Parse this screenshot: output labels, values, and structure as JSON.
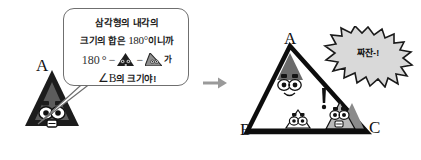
{
  "scene": {
    "title": "triangle-interior-angle-sum-cartoon",
    "colors": {
      "ink": "#111111",
      "bubble_border": "#6f6f6f",
      "burst_fill": "#d9d9d9",
      "burst_border": "#1a1a1a",
      "triangle_dark": "#2b2b2b",
      "triangle_gray": "#8c8c8c",
      "arrow_gray": "#9a9a9a",
      "page_bg": "#ffffff"
    }
  },
  "speech_bubble": {
    "line1": "삼각형의 내각의",
    "line2_prefix": "크기의 합은 ",
    "line2_number": "180",
    "line2_degree": "°",
    "line2_suffix": "이니까",
    "equation": {
      "number": "180",
      "degree": "°",
      "minus1": "−",
      "term1_icon": "dark-triangle-character-icon",
      "minus2": "−",
      "term2_icon": "gray-triangle-character-icon",
      "particle": "가"
    },
    "line4_angle": "∠B",
    "line4_text": "의 크기야!",
    "tail_direction": "down-left"
  },
  "left_character": {
    "label": "A",
    "icon": "dark-triangle-character-with-glasses-icon"
  },
  "transition": {
    "icon": "right-arrow-icon"
  },
  "right_scene": {
    "vertex_labels": {
      "top": "A",
      "bottom_left": "B",
      "bottom_right": "C"
    },
    "characters": [
      {
        "position": "top-vertex",
        "icon": "dark-triangle-character-with-glasses-icon"
      },
      {
        "position": "bottom-center",
        "icon": "small-triangle-character-icon"
      },
      {
        "position": "bottom-right",
        "icon": "gray-triangle-character-icon"
      }
    ],
    "exclamation": "!",
    "burst": {
      "text": "짜잔-!",
      "shape": "starburst"
    }
  }
}
